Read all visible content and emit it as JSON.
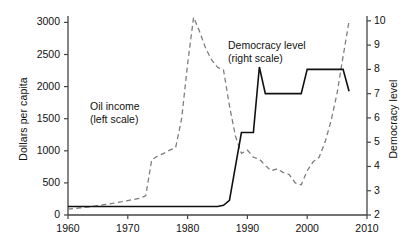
{
  "chart_data": {
    "type": "line",
    "title": "",
    "xlabel": "",
    "ylabel": "Dollars per capita",
    "ylabel_right": "Democracy level",
    "xlim": [
      1960,
      2010
    ],
    "ylim": [
      0,
      3100
    ],
    "ylim_right": [
      2,
      10.2
    ],
    "xticks": [
      1960,
      1970,
      1980,
      1990,
      2000,
      2010
    ],
    "yticks_left": [
      0,
      500,
      1000,
      1500,
      2000,
      2500,
      3000
    ],
    "yticks_right": [
      2,
      3,
      4,
      5,
      6,
      7,
      8,
      9,
      10
    ],
    "grid": false,
    "legend_position": "inline-annotations",
    "annotations": [
      {
        "name": "oil-income",
        "line1": "Oil income",
        "line2": "(left scale)"
      },
      {
        "name": "democracy-level",
        "line1": "Democracy level",
        "line2": "(right scale)"
      }
    ],
    "series": [
      {
        "name": "Oil income (left scale)",
        "axis": "left",
        "style": "dashed",
        "color": "#7a7a7a",
        "x": [
          1960,
          1962,
          1964,
          1966,
          1968,
          1970,
          1972,
          1973,
          1974,
          1975,
          1976,
          1977,
          1978,
          1979,
          1980,
          1981,
          1982,
          1983,
          1984,
          1985,
          1986,
          1987,
          1988,
          1989,
          1990,
          1991,
          1992,
          1993,
          1994,
          1995,
          1996,
          1997,
          1998,
          1999,
          2000,
          2001,
          2002,
          2003,
          2004,
          2005,
          2006,
          2007
        ],
        "values": [
          90,
          110,
          130,
          160,
          190,
          225,
          260,
          300,
          860,
          920,
          960,
          1010,
          1050,
          1500,
          2350,
          3080,
          2860,
          2600,
          2420,
          2300,
          2260,
          1700,
          1230,
          960,
          1010,
          900,
          870,
          770,
          690,
          720,
          660,
          630,
          500,
          470,
          690,
          830,
          900,
          1140,
          1470,
          1900,
          2470,
          3020
        ]
      },
      {
        "name": "Democracy level (right scale)",
        "axis": "right",
        "style": "solid",
        "color": "#111111",
        "x": [
          1960,
          1975,
          1985,
          1986,
          1987,
          1988,
          1989,
          1990,
          1991,
          1992,
          1993,
          1994,
          1995,
          1996,
          1997,
          1998,
          1999,
          2000,
          2001,
          2002,
          2003,
          2004,
          2005,
          2006,
          2007
        ],
        "values": [
          2.35,
          2.35,
          2.35,
          2.4,
          2.6,
          4,
          5.4,
          5.4,
          5.4,
          8.1,
          7,
          7,
          7,
          7,
          7,
          7,
          7,
          8,
          8,
          8,
          8,
          8,
          8,
          8,
          7.1
        ]
      }
    ]
  }
}
